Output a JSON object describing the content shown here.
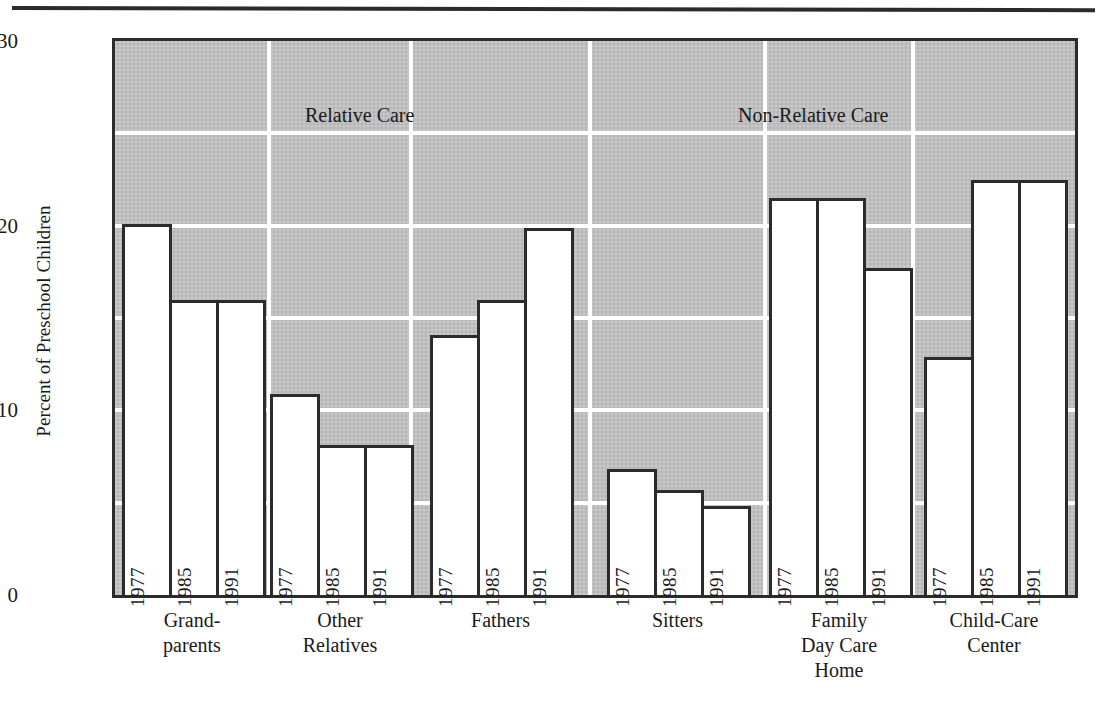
{
  "chart_data": {
    "type": "bar",
    "title": "",
    "xlabel": "",
    "ylabel": "Percent of Preschool Children",
    "ylim": [
      0,
      30
    ],
    "yticks": [
      0,
      10,
      20,
      30
    ],
    "ytick_labels": [
      "0",
      "10",
      "20",
      "30"
    ],
    "minor_gridlines": [
      5,
      15,
      25
    ],
    "grid": true,
    "legend": "none",
    "series_labels": [
      "1977",
      "1985",
      "1991"
    ],
    "categories": [
      "Grand-parents",
      "Other Relatives",
      "Fathers",
      "Sitters",
      "Family Day Care Home",
      "Child-Care Center"
    ],
    "sections": [
      {
        "label": "Relative Care",
        "categories": [
          "Grand-parents",
          "Other Relatives",
          "Fathers"
        ]
      },
      {
        "label": "Non-Relative Care",
        "categories": [
          "Sitters",
          "Family Day Care Home",
          "Child-Care Center"
        ]
      }
    ],
    "series": [
      {
        "name": "1977",
        "values": [
          20.1,
          10.9,
          14.1,
          6.8,
          21.5,
          12.9
        ]
      },
      {
        "name": "1985",
        "values": [
          16.0,
          8.1,
          16.0,
          5.7,
          21.5,
          22.5
        ]
      },
      {
        "name": "1991",
        "values": [
          16.0,
          8.1,
          19.9,
          4.8,
          17.7,
          22.5
        ]
      }
    ],
    "colors": {
      "plot_background": "#bdbdbd",
      "bar_fill": "#ffffff",
      "bar_outline": "#2b2b2b",
      "gridline": "#ffffff",
      "text": "#1a1a1a"
    }
  },
  "axis": {
    "y_title": "Percent of Preschool Children",
    "ticks": [
      "30",
      "20",
      "10",
      "0"
    ]
  },
  "sections": {
    "relative": "Relative Care",
    "non_relative": "Non-Relative Care"
  },
  "groups": [
    {
      "line1": "Grand-",
      "line2": "parents",
      "line3": ""
    },
    {
      "line1": "Other",
      "line2": "Relatives",
      "line3": ""
    },
    {
      "line1": "Fathers",
      "line2": "",
      "line3": ""
    },
    {
      "line1": "Sitters",
      "line2": "",
      "line3": ""
    },
    {
      "line1": "Family",
      "line2": "Day Care",
      "line3": "Home"
    },
    {
      "line1": "Child-Care",
      "line2": "Center",
      "line3": ""
    }
  ],
  "years": [
    "1977",
    "1985",
    "1991"
  ]
}
